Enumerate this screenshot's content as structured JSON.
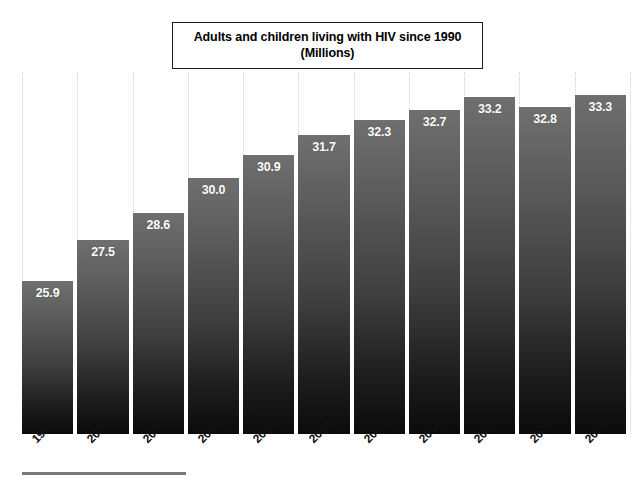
{
  "chart_data": {
    "type": "bar",
    "title": "Adults and children living with HIV since 1990 (Millions)",
    "title_lines": [
      "Adults and children living with HIV since 1990",
      "(Millions)"
    ],
    "xlabel": "",
    "ylabel": "",
    "categories": [
      "1999",
      "2000",
      "2001",
      "2002",
      "2003",
      "2004",
      "2005",
      "2006",
      "2007",
      "2008",
      "2009"
    ],
    "values": [
      25.9,
      27.5,
      28.6,
      30.0,
      30.9,
      31.7,
      32.3,
      32.7,
      33.2,
      32.8,
      33.3
    ],
    "value_labels": [
      "25.9",
      "27.5",
      "28.6",
      "30.0",
      "30.9",
      "31.7",
      "32.3",
      "32.7",
      "33.2",
      "32.8",
      "33.3"
    ],
    "ylim": [
      19.8,
      34.2
    ],
    "grid": "vertical-dotted",
    "legend": "none",
    "series": [
      {
        "name": "Adults and children living with HIV (Millions)",
        "values": [
          25.9,
          27.5,
          28.6,
          30.0,
          30.9,
          31.7,
          32.3,
          32.7,
          33.2,
          32.8,
          33.3
        ]
      }
    ],
    "colors": {
      "bar_top": "#6f6f6f",
      "bar_bottom": "#0b0b0b",
      "value_label": "#ffffff",
      "gridline": "#d2d2d2",
      "title_border": "#1a1a1a",
      "background": "#ffffff",
      "bottom_rule": "#787878",
      "axis_label": "#111111"
    }
  }
}
